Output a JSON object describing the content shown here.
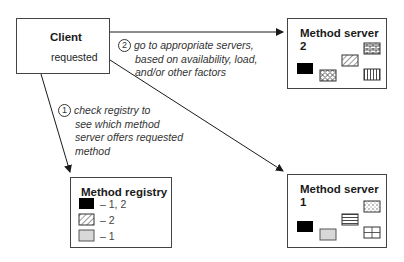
{
  "client": {
    "title": "Client",
    "requested_label": "requested"
  },
  "server2": {
    "title_line1": "Method server",
    "title_line2": "2"
  },
  "server1": {
    "title_line1": "Method server",
    "title_line2": "1"
  },
  "registry": {
    "title": "Method registry",
    "entries": [
      {
        "pattern": "solid-black",
        "label": "– 1, 2"
      },
      {
        "pattern": "diagonal-hatch",
        "label": "– 2"
      },
      {
        "pattern": "light-gray",
        "label": "– 1"
      }
    ]
  },
  "steps": [
    {
      "number": "1",
      "text_lines": [
        "check registry to",
        "see which method",
        "server offers requested",
        "method"
      ]
    },
    {
      "number": "2",
      "text_lines": [
        "go to appropriate servers,",
        "based on availability, load,",
        "and/or other factors"
      ]
    }
  ],
  "colors": {
    "line": "#1a1a1a",
    "box_border": "#444444",
    "gray_fill": "#d8d8d8"
  }
}
